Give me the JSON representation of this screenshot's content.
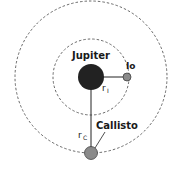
{
  "diagram": {
    "labels": {
      "jupiter": "Jupiter",
      "io": "Io",
      "callisto": "Callisto",
      "r_io": "r",
      "r_io_sub": "I",
      "r_callisto": "r",
      "r_callisto_sub": "C"
    },
    "colors": {
      "jupiter": "#222222",
      "moon": "#8a8a8a",
      "orbit": "#444444",
      "line": "#222222"
    }
  }
}
